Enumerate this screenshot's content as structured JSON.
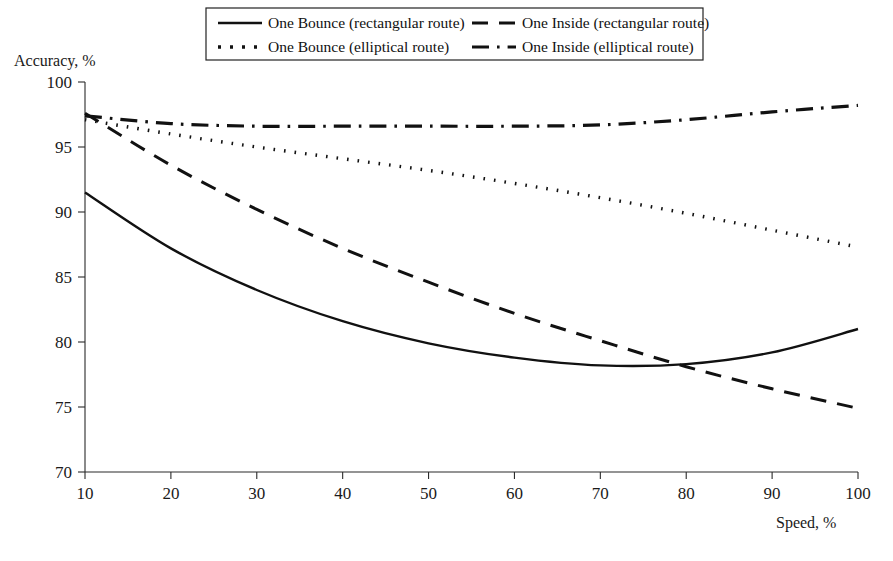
{
  "chart_data": {
    "type": "line",
    "title": "",
    "xlabel": "Speed, %",
    "ylabel": "Accuracy, %",
    "xlim": [
      10,
      100
    ],
    "ylim": [
      70,
      100
    ],
    "xticks": [
      10,
      20,
      30,
      40,
      50,
      60,
      70,
      80,
      90,
      100
    ],
    "yticks": [
      70,
      75,
      80,
      85,
      90,
      95,
      100
    ],
    "grid": false,
    "legend_position": "top-center",
    "x": [
      10,
      20,
      30,
      40,
      50,
      60,
      70,
      80,
      90,
      100
    ],
    "series": [
      {
        "name": "One Bounce (rectangular route)",
        "style": "solid",
        "color": "#111111",
        "values": [
          91.5,
          87.2,
          84.0,
          81.6,
          79.9,
          78.8,
          78.2,
          78.3,
          79.2,
          81.0
        ]
      },
      {
        "name": "One Inside (rectangular route)",
        "style": "dashed",
        "color": "#111111",
        "values": [
          97.6,
          93.6,
          90.2,
          87.2,
          84.6,
          82.2,
          80.1,
          78.1,
          76.4,
          74.9
        ]
      },
      {
        "name": "One Bounce (elliptical route)",
        "style": "dotted",
        "color": "#111111",
        "values": [
          97.1,
          96.0,
          95.0,
          94.1,
          93.2,
          92.2,
          91.1,
          89.9,
          88.6,
          87.3
        ]
      },
      {
        "name": "One Inside (elliptical route)",
        "style": "dashdot",
        "color": "#111111",
        "values": [
          97.4,
          96.8,
          96.6,
          96.6,
          96.6,
          96.6,
          96.7,
          97.1,
          97.7,
          98.2
        ]
      }
    ]
  },
  "legend": {
    "entries": [
      {
        "label": "One Bounce (rectangular route)",
        "style": "solid"
      },
      {
        "label": "One Inside (rectangular route)",
        "style": "dashed"
      },
      {
        "label": "One Bounce (elliptical route)",
        "style": "dotted"
      },
      {
        "label": "One Inside (elliptical route)",
        "style": "dashdot"
      }
    ]
  },
  "axes": {
    "y_title": "Accuracy, %",
    "x_title": "Speed, %",
    "y_tick_labels": [
      "100",
      "95",
      "90",
      "85",
      "80",
      "75",
      "70"
    ],
    "x_tick_labels": [
      "10",
      "20",
      "30",
      "40",
      "50",
      "60",
      "70",
      "80",
      "90",
      "100"
    ]
  }
}
